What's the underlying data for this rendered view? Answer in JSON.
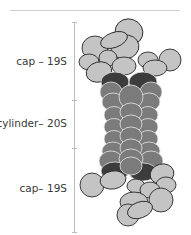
{
  "diagram": {
    "labels": [
      {
        "id": "top-cap",
        "text": "cap – 19S"
      },
      {
        "id": "cylinder",
        "text": "cylinder– 20S"
      },
      {
        "id": "bottom-cap",
        "text": "cap– 19S"
      }
    ],
    "colors": {
      "cap": "#c4c4c4",
      "cylinder": "#7b7b7b",
      "ring": "#3c3c3c",
      "outline": "#2a2a2a",
      "bracket": "#bdbdbd",
      "text": "#3a3a3a"
    }
  }
}
